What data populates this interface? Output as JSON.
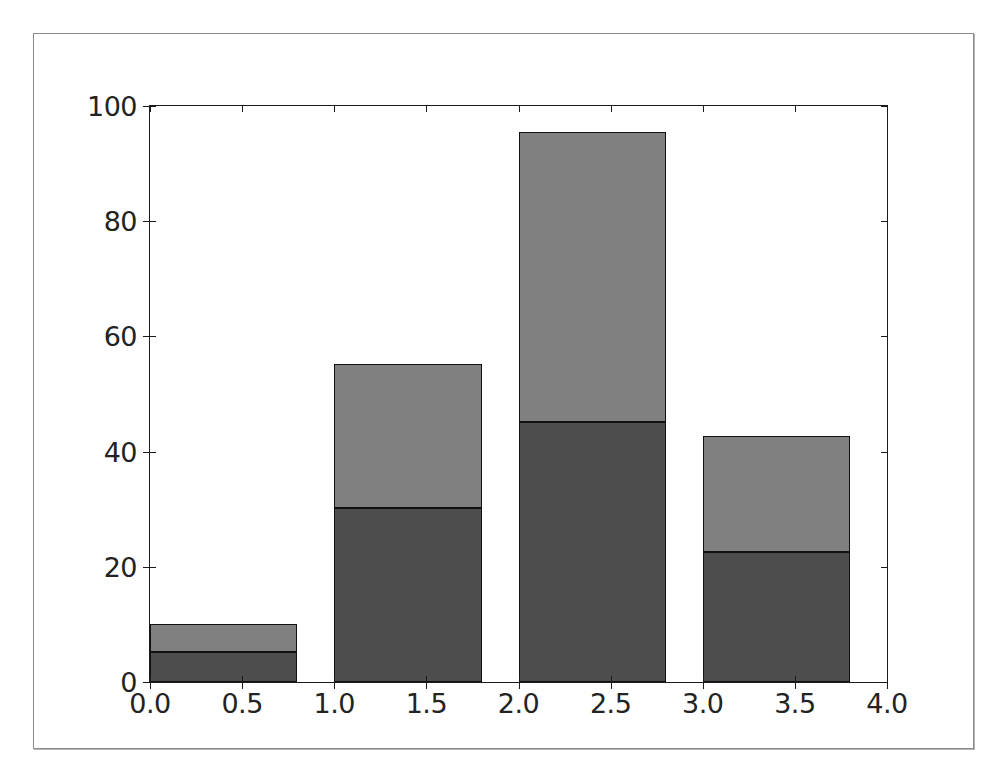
{
  "figure": {
    "background": "#ffffff",
    "frame_color": "#8a8a8a",
    "axes_color": "#1a1a1a"
  },
  "chart_data": {
    "type": "bar",
    "title": "",
    "subtitle": "",
    "xlabel": "",
    "ylabel": "",
    "stacked": true,
    "grid": false,
    "legend": null,
    "xlim": [
      0.0,
      4.0
    ],
    "ylim": [
      0,
      100
    ],
    "xticks": [
      0.0,
      0.5,
      1.0,
      1.5,
      2.0,
      2.5,
      3.0,
      3.5,
      4.0
    ],
    "xtick_labels": [
      "0.0",
      "0.5",
      "1.0",
      "1.5",
      "2.0",
      "2.5",
      "3.0",
      "3.5",
      "4.0"
    ],
    "yticks": [
      0,
      20,
      40,
      60,
      80,
      100
    ],
    "ytick_labels": [
      "0",
      "20",
      "40",
      "60",
      "80",
      "100"
    ],
    "bar_width": 0.8,
    "bar_left_edges": [
      0.0,
      1.0,
      2.0,
      3.0
    ],
    "categories": [
      "0",
      "1",
      "2",
      "3"
    ],
    "series": [
      {
        "name": "lower",
        "color": "#4d4d4d",
        "values": [
          5.2,
          30.2,
          45.1,
          22.6
        ]
      },
      {
        "name": "upper",
        "color": "#808080",
        "values": [
          4.9,
          25.0,
          50.4,
          20.1
        ]
      }
    ],
    "totals": [
      10.1,
      55.2,
      95.5,
      42.7
    ],
    "edge_color": "#111111"
  }
}
